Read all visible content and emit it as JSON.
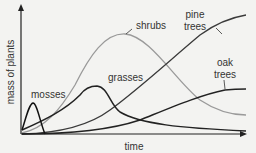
{
  "diagram": {
    "type": "succession-graph",
    "x_axis_label": "time",
    "y_axis_label": "mass of plants",
    "curves": [
      {
        "name": "mosses",
        "label": "mosses",
        "color": "#222222"
      },
      {
        "name": "grasses",
        "label": "grasses",
        "color": "#222222"
      },
      {
        "name": "shrubs",
        "label": "shrubs",
        "color": "#999999"
      },
      {
        "name": "pine trees",
        "label_line1": "pine",
        "label_line2": "trees",
        "color": "#333333"
      },
      {
        "name": "oak trees",
        "label_line1": "oak",
        "label_line2": "trees",
        "color": "#222222"
      }
    ]
  }
}
